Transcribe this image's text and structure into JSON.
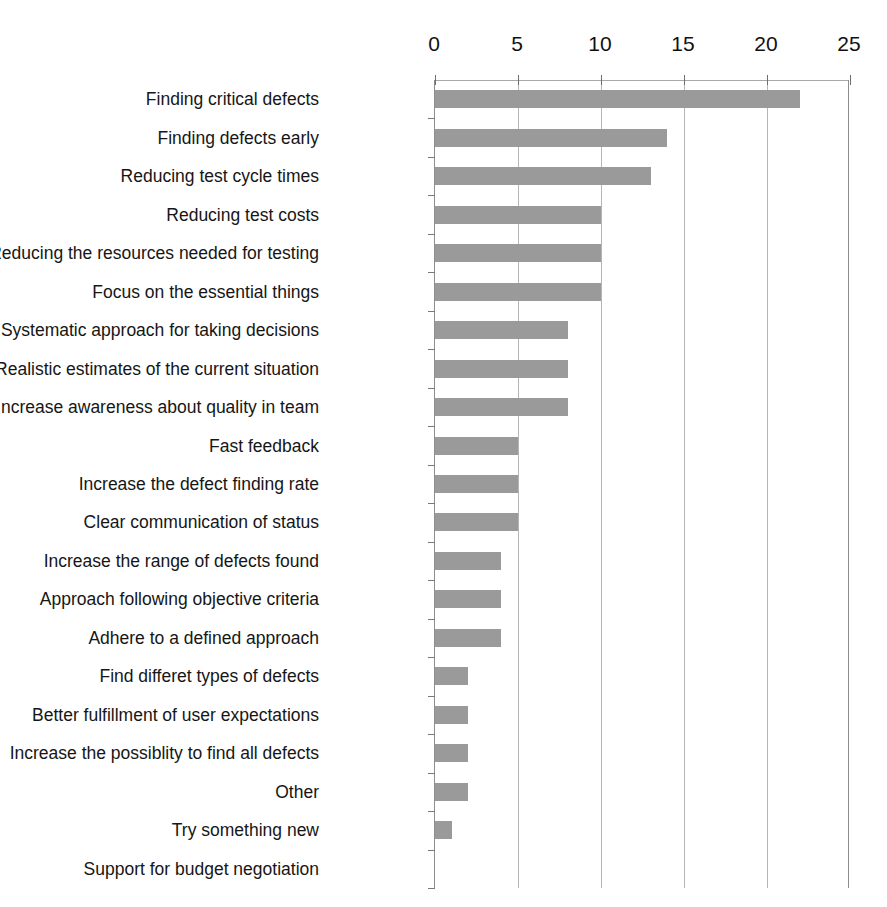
{
  "chart_data": {
    "type": "bar",
    "orientation": "horizontal",
    "title": "",
    "xlabel": "",
    "ylabel": "",
    "xlim": [
      0,
      25
    ],
    "x_ticks": [
      0,
      5,
      10,
      15,
      20,
      25
    ],
    "x_tick_labels": [
      "0",
      "5",
      "10",
      "15",
      "20",
      "25"
    ],
    "grid": true,
    "grid_axis": "x",
    "legend": false,
    "bar_color": "#9a9a9a",
    "axis_color": "#8d8d8d",
    "gridline_color": "#b5b5b5",
    "categories": [
      "Finding critical defects",
      "Finding defects early",
      "Reducing test cycle times",
      "Reducing test costs",
      "Reducing the resources needed for testing",
      "Focus on the essential things",
      "Systematic approach for taking decisions",
      "Realistic estimates of the current situation",
      "Increase awareness about quality in team",
      "Fast feedback",
      "Increase the defect finding rate",
      "Clear communication of status",
      "Increase the range of defects found",
      "Approach following objective criteria",
      "Adhere to a defined approach",
      "Find differet types of defects",
      "Better fulfillment of user expectations",
      "Increase the possiblity to find all defects",
      "Other",
      "Try something new",
      "Support for budget negotiation"
    ],
    "values": [
      22,
      14,
      13,
      10,
      10,
      10,
      8,
      8,
      8,
      5,
      5,
      5,
      4,
      4,
      4,
      2,
      2,
      2,
      2,
      1,
      0
    ]
  }
}
